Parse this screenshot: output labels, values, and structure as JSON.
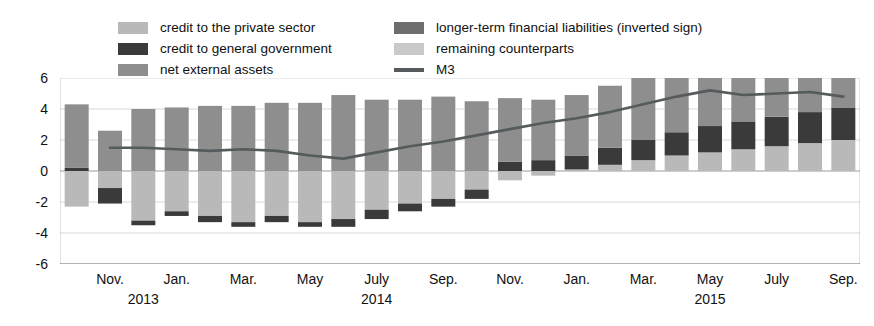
{
  "legend": {
    "columns": [
      {
        "items": [
          {
            "label": "credit to the private sector",
            "color": "#b9b9b9",
            "marker": "box"
          },
          {
            "label": "credit to general government",
            "color": "#3a3a3a",
            "marker": "box"
          },
          {
            "label": "net external assets",
            "color": "#8e8e8e",
            "marker": "box"
          }
        ]
      },
      {
        "items": [
          {
            "label": "longer-term financial liabilities (inverted sign)",
            "color": "#6e6e6e",
            "marker": "box"
          },
          {
            "label": "remaining counterparts",
            "color": "#c9c9c9",
            "marker": "box"
          },
          {
            "label": "M3",
            "color": "#555a5c",
            "marker": "line"
          }
        ]
      }
    ]
  },
  "axes": {
    "y_ticks": [
      6,
      4,
      2,
      0,
      -2,
      -4,
      -6
    ],
    "y_min": -6,
    "y_max": 6,
    "x_tick_labels": [
      {
        "label": "Nov.",
        "index": 1
      },
      {
        "label": "Jan.",
        "index": 3
      },
      {
        "label": "Mar.",
        "index": 5
      },
      {
        "label": "May",
        "index": 7
      },
      {
        "label": "July",
        "index": 9
      },
      {
        "label": "Sep.",
        "index": 11
      },
      {
        "label": "Nov.",
        "index": 13
      },
      {
        "label": "Jan.",
        "index": 15
      },
      {
        "label": "Mar.",
        "index": 17
      },
      {
        "label": "May",
        "index": 19
      },
      {
        "label": "July",
        "index": 21
      },
      {
        "label": "Sep.",
        "index": 23
      }
    ],
    "year_labels": [
      {
        "label": "2013",
        "index": 2
      },
      {
        "label": "2014",
        "index": 9
      },
      {
        "label": "2015",
        "index": 19
      }
    ]
  },
  "chart_data": {
    "type": "bar",
    "stacked": true,
    "title": "",
    "xlabel": "",
    "ylabel": "",
    "ylim": [
      -6,
      6
    ],
    "grid": true,
    "legend_position": "top",
    "categories": [
      "Oct. 2013",
      "Nov. 2013",
      "Dec. 2013",
      "Jan. 2014",
      "Feb. 2014",
      "Mar. 2014",
      "Apr. 2014",
      "May 2014",
      "June 2014",
      "July 2014",
      "Aug. 2014",
      "Sep. 2014",
      "Oct. 2014",
      "Nov. 2014",
      "Dec. 2014",
      "Jan. 2015",
      "Feb. 2015",
      "Mar. 2015",
      "Apr. 2015",
      "May 2015",
      "June 2015",
      "July 2015",
      "Aug. 2015",
      "Sep. 2015"
    ],
    "series": [
      {
        "name": "credit to the private sector",
        "color": "#b9b9b9",
        "values": [
          -2.3,
          -1.1,
          -3.2,
          -2.6,
          -2.9,
          -3.3,
          -2.9,
          -3.3,
          -3.1,
          -2.5,
          -2.1,
          -1.8,
          -1.2,
          -0.6,
          -0.3,
          0.1,
          0.4,
          0.7,
          1.0,
          1.2,
          1.4,
          1.6,
          1.8,
          2.0
        ]
      },
      {
        "name": "credit to general government",
        "color": "#3a3a3a",
        "values": [
          0.2,
          -1.0,
          -0.3,
          -0.3,
          -0.4,
          -0.3,
          -0.4,
          -0.3,
          -0.5,
          -0.6,
          -0.5,
          -0.5,
          -0.6,
          0.6,
          0.7,
          0.9,
          1.1,
          1.3,
          1.5,
          1.7,
          1.8,
          1.9,
          2.0,
          2.1
        ]
      },
      {
        "name": "net external assets",
        "color": "#8e8e8e",
        "values": [
          4.1,
          2.6,
          4.0,
          4.1,
          4.2,
          4.2,
          4.4,
          4.4,
          4.9,
          4.6,
          4.6,
          4.8,
          4.5,
          4.1,
          3.9,
          3.9,
          4.0,
          4.2,
          4.4,
          4.5,
          4.5,
          4.5,
          4.6,
          4.5
        ]
      },
      {
        "name": "longer-term financial liabilities (inverted sign)",
        "color": "#6e6e6e",
        "values": [
          0.0,
          0.0,
          0.0,
          0.0,
          0.0,
          0.0,
          0.0,
          0.0,
          0.0,
          0.0,
          0.0,
          0.0,
          0.0,
          0.0,
          0.0,
          0.0,
          0.0,
          0.0,
          0.0,
          0.0,
          0.0,
          0.0,
          0.0,
          0.0
        ]
      },
      {
        "name": "remaining counterparts",
        "color": "#c9c9c9",
        "values": [
          0.0,
          0.0,
          0.0,
          0.0,
          0.0,
          0.0,
          0.0,
          0.0,
          0.0,
          0.0,
          0.0,
          0.0,
          0.0,
          0.0,
          0.0,
          0.0,
          0.0,
          0.0,
          0.0,
          0.0,
          0.0,
          0.0,
          0.0,
          0.0
        ]
      }
    ],
    "line_series": {
      "name": "M3",
      "color": "#555a5c",
      "values": [
        null,
        1.5,
        1.5,
        1.4,
        1.3,
        1.4,
        1.3,
        1.0,
        0.8,
        1.2,
        1.6,
        1.9,
        2.3,
        2.7,
        3.1,
        3.4,
        3.8,
        4.3,
        4.8,
        5.2,
        4.9,
        5.0,
        5.1,
        4.8
      ]
    }
  }
}
